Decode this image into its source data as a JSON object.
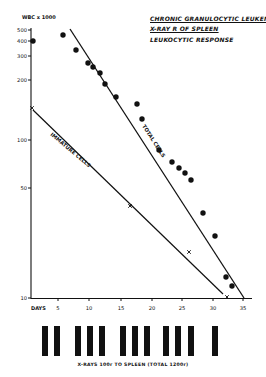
{
  "chart_data": {
    "type": "scatter",
    "title": "Chronic Granulocytic Leukemia",
    "subtitle": "X-Ray Rx of Spleen",
    "caption": "Leukocytic Response",
    "ylabel": "WBC x 1000",
    "xlabel": "DAYS",
    "yscale": "log",
    "ylim": [
      10,
      500
    ],
    "xlim": [
      0,
      35
    ],
    "x_ticks": [
      5,
      10,
      15,
      20,
      25,
      30,
      35
    ],
    "y_ticks": [
      10,
      50,
      100,
      200,
      300,
      400,
      500
    ],
    "grid": false,
    "series": [
      {
        "name": "Total Cells (observed)",
        "marker": "filled-circle",
        "points": [
          {
            "x": 0,
            "y": 420
          },
          {
            "x": 5,
            "y": 450
          },
          {
            "x": 7,
            "y": 370
          },
          {
            "x": 9,
            "y": 310
          },
          {
            "x": 10,
            "y": 295
          },
          {
            "x": 11.5,
            "y": 270
          },
          {
            "x": 12.5,
            "y": 230
          },
          {
            "x": 14.5,
            "y": 190
          },
          {
            "x": 18.5,
            "y": 165
          },
          {
            "x": 19.5,
            "y": 140
          },
          {
            "x": 22,
            "y": 88
          },
          {
            "x": 24,
            "y": 73
          },
          {
            "x": 25,
            "y": 67
          },
          {
            "x": 26,
            "y": 61
          },
          {
            "x": 27,
            "y": 57
          },
          {
            "x": 29,
            "y": 37
          },
          {
            "x": 31,
            "y": 25
          },
          {
            "x": 33,
            "y": 13
          },
          {
            "x": 34,
            "y": 11.5
          }
        ]
      },
      {
        "name": "Total Cells (trend line)",
        "marker": "line",
        "label": "TOTAL CELLS",
        "points": [
          {
            "x": 6.5,
            "y": 480
          },
          {
            "x": 35,
            "y": 10
          }
        ]
      },
      {
        "name": "Immature Cells",
        "marker": "x",
        "label": "IMMATURE CELLS",
        "points": [
          {
            "x": 0,
            "y": 150
          },
          {
            "x": 17,
            "y": 41
          },
          {
            "x": 26,
            "y": 22
          },
          {
            "x": 32.5,
            "y": 10.5
          }
        ],
        "trend_line": [
          {
            "x": 0,
            "y": 145
          },
          {
            "x": 32,
            "y": 10.5
          }
        ]
      }
    ],
    "annotations": [
      {
        "text": "X-RAYS 100r TO SPLEEN (TOTAL 1200r)",
        "position": "bottom"
      }
    ],
    "xray_doses": {
      "count": 12,
      "dose_each": "100r",
      "total": "1200r"
    }
  },
  "labels": {
    "title_line1": "CHRONIC GRANULOCYTIC LEUKEMIA",
    "title_line2": "X-RAY R OF SPLEEN",
    "title_line3": "LEUKOCYTIC RESPONSE",
    "ylabel": "WBC x 1000",
    "xlabel": "DAYS",
    "total_cells": "TOTAL CELLS",
    "immature_cells": "IMMATURE CELLS",
    "footer": "X-RAYS 100r TO SPLEEN (TOTAL 1200r)"
  },
  "axis": {
    "y_ticks": [
      {
        "label": "500",
        "y": 30
      },
      {
        "label": "400",
        "y": 41
      },
      {
        "label": "300",
        "y": 56
      },
      {
        "label": "200",
        "y": 80
      },
      {
        "label": "100",
        "y": 140
      },
      {
        "label": "50",
        "y": 188
      },
      {
        "label": "10",
        "y": 298
      }
    ],
    "x_ticks": [
      {
        "label": "5",
        "x": 58
      },
      {
        "label": "10",
        "x": 89
      },
      {
        "label": "15",
        "x": 121
      },
      {
        "label": "20",
        "x": 152
      },
      {
        "label": "25",
        "x": 182
      },
      {
        "label": "30",
        "x": 213
      },
      {
        "label": "35",
        "x": 243
      }
    ]
  },
  "plot_pixels": {
    "dots": [
      [
        33,
        41
      ],
      [
        63,
        35
      ],
      [
        76,
        50
      ],
      [
        88,
        63
      ],
      [
        93,
        67
      ],
      [
        100,
        73
      ],
      [
        105,
        84
      ],
      [
        116,
        97
      ],
      [
        137,
        104
      ],
      [
        142,
        119
      ],
      [
        159,
        150
      ],
      [
        172,
        162
      ],
      [
        179,
        168
      ],
      [
        185,
        173
      ],
      [
        191,
        180
      ],
      [
        203,
        213
      ],
      [
        215,
        236
      ],
      [
        226,
        277
      ],
      [
        232,
        286
      ]
    ],
    "crosses": [
      [
        32,
        108
      ],
      [
        130,
        206
      ],
      [
        189,
        252
      ],
      [
        227,
        297
      ]
    ],
    "total_line": [
      [
        70,
        29
      ],
      [
        244,
        298
      ]
    ],
    "immature_line": [
      [
        33,
        110
      ],
      [
        223,
        294
      ]
    ],
    "bars_x": [
      45,
      57,
      78,
      90,
      102,
      123,
      135,
      147,
      166,
      178,
      191,
      215
    ]
  }
}
